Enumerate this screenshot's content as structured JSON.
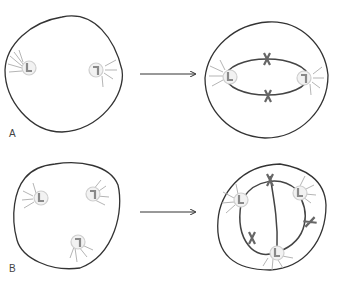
{
  "panels": [
    {
      "label": "A",
      "description": "Two centrosomes at opposite poles; after arrow, bipolar spindle with two chromosomes"
    },
    {
      "label": "B",
      "description": "Three centrosomes; after arrow, tripolar spindle with three chromosomes"
    }
  ],
  "colors": {
    "cell_outline": "#333333",
    "spindle": "#444444",
    "centrosome_ring": "#cccccc",
    "centriole": "#888888",
    "aster_rays": "#b0b0b0",
    "chromosome": "#666666"
  }
}
